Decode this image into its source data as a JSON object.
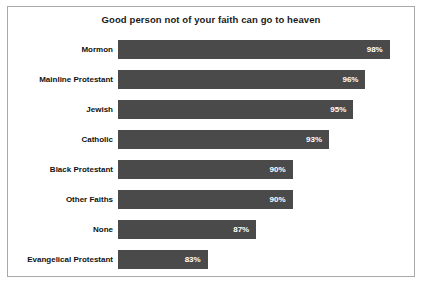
{
  "chart_data": {
    "type": "bar",
    "orientation": "horizontal",
    "title": "Good person not of your faith can go to heaven",
    "xlabel": "",
    "ylabel": "",
    "grid": false,
    "legend": false,
    "axis_visible": false,
    "value_suffix": "%",
    "xlim": [
      0,
      100
    ],
    "bar_color": "#4a4a4a",
    "value_label_color": "#ffffff",
    "border_color": "#a9a9a9",
    "background_color": "#ffffff",
    "categories": [
      "Mormon",
      "Mainline Protestant",
      "Jewish",
      "Catholic",
      "Black Protestant",
      "Other Faiths",
      "None",
      "Evangelical Protestant"
    ],
    "values": [
      98,
      96,
      95,
      93,
      90,
      90,
      87,
      83
    ],
    "value_labels": [
      "98%",
      "96%",
      "95%",
      "93%",
      "90%",
      "90%",
      "87%",
      "83%"
    ]
  }
}
